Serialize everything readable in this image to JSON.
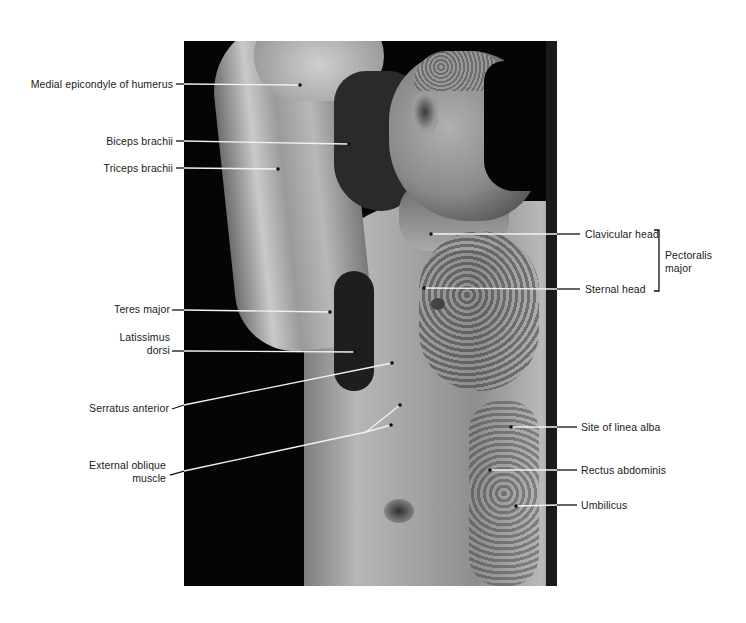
{
  "figure": {
    "type": "anatomical-photo-labeled",
    "colors": {
      "background": "#ffffff",
      "photo_background": "#050505",
      "label_text": "#1a1a1a",
      "leader_line_on_light": "#111111",
      "leader_line_on_dark": "#f2f2f2"
    },
    "labels_left": [
      {
        "id": "medial-epicondyle",
        "text": "Medial epicondyle of humerus"
      },
      {
        "id": "biceps-brachii",
        "text": "Biceps brachii"
      },
      {
        "id": "triceps-brachii",
        "text": "Triceps brachii"
      },
      {
        "id": "teres-major",
        "text": "Teres major"
      },
      {
        "id": "latissimus-dorsi",
        "line1": "Latissimus",
        "line2": "dorsi"
      },
      {
        "id": "serratus-anterior",
        "text": "Serratus anterior"
      },
      {
        "id": "external-oblique",
        "line1": "External oblique",
        "line2": "muscle"
      }
    ],
    "labels_right": [
      {
        "id": "clavicular-head",
        "text": "Clavicular head"
      },
      {
        "id": "sternal-head",
        "text": "Sternal head"
      },
      {
        "id": "site-of-linea-alba",
        "text": "Site of linea alba"
      },
      {
        "id": "rectus-abdominis",
        "text": "Rectus abdominis"
      },
      {
        "id": "umbilicus",
        "text": "Umbilicus"
      }
    ],
    "group_bracket": {
      "line1": "Pectoralis",
      "line2": "major",
      "spans": [
        "Clavicular head",
        "Sternal head"
      ]
    }
  }
}
